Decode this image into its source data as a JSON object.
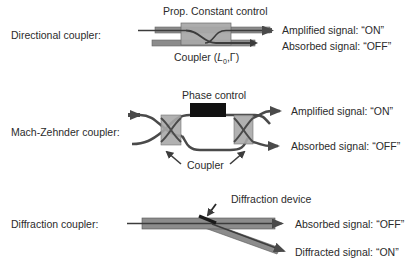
{
  "directional": {
    "name": "Directional coupler:",
    "control": "Prop. Constant control",
    "coupler_prefix": "Coupler (",
    "coupler_L": "L",
    "coupler_sub": "0",
    "coupler_suffix": ",Γ)",
    "out_on": "Amplified signal: “ON”",
    "out_off": "Absorbed signal: “OFF”"
  },
  "mach_zehnder": {
    "name": "Mach-Zehnder coupler:",
    "control": "Phase control",
    "coupler": "Coupler",
    "out_on": "Amplified signal: “ON”",
    "out_off": "Absorbed signal: “OFF”"
  },
  "diffraction": {
    "name": "Diffraction coupler:",
    "device": "Diffraction device",
    "out_off": "Absorbed signal: “OFF”",
    "out_on": "Diffracted signal: “ON”"
  },
  "colors": {
    "waveguide": "#8c8c8c",
    "coupler_box": "#a9a9a9",
    "line": "#3c3c3c",
    "phase_block": "#111111"
  }
}
